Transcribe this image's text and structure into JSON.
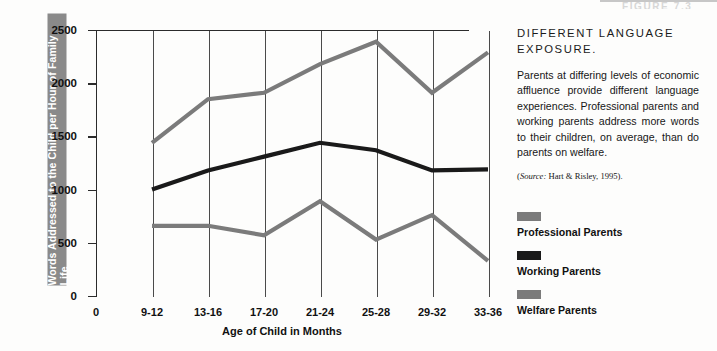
{
  "figure_header": "FIGURE 7.3",
  "chart_data": {
    "type": "line",
    "title": "",
    "xlabel": "Age of Child in Months",
    "ylabel": "Words Addressed to the Child per Hour of Family Life",
    "categories": [
      "9-12",
      "13-16",
      "17-20",
      "21-24",
      "25-28",
      "29-32",
      "33-36"
    ],
    "x_origin_label": "0",
    "ylim": [
      0,
      2500
    ],
    "yticks": [
      0,
      500,
      1000,
      1500,
      2000,
      2500
    ],
    "grid": "vertical-only",
    "legend_position": "right",
    "series": [
      {
        "name": "Professional Parents",
        "color": "#7b7b7b",
        "values": [
          1440,
          1850,
          1910,
          2180,
          2390,
          1910,
          2290
        ]
      },
      {
        "name": "Working Parents",
        "color": "#1a1a1a",
        "values": [
          1000,
          1180,
          1310,
          1440,
          1370,
          1180,
          1190
        ]
      },
      {
        "name": "Welfare Parents",
        "color": "#7b7b7b",
        "values": [
          660,
          660,
          570,
          890,
          530,
          760,
          330
        ]
      }
    ]
  },
  "caption": {
    "title": "DIFFERENT LANGUAGE EXPOSURE.",
    "body": "Parents at differing levels of economic affluence provide different language experiences. Professional parents and working parents address more words to their children, on average, than do parents on welfare.",
    "source_prefix": "(",
    "source_label": "Source:",
    "source_text": " Hart &  Risley, 1995).",
    "source_full": "(Source: Hart &  Risley, 1995)."
  },
  "legend": [
    {
      "label": "Professional Parents",
      "color": "#7b7b7b"
    },
    {
      "label": "Working Parents",
      "color": "#1a1a1a"
    },
    {
      "label": "Welfare Parents",
      "color": "#7b7b7b"
    }
  ],
  "colors": {
    "axis": "#2b2b2b",
    "gridline": "#4a4a4a",
    "y_title_band": "#8a8a8a",
    "text": "#111111"
  }
}
